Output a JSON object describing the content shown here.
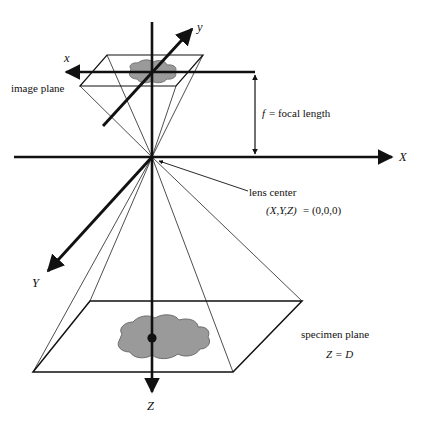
{
  "diagram": {
    "colors": {
      "stroke": "#111111",
      "thin_stroke": "#3a3a3a",
      "blob_fill": "#9a9a9a",
      "blob_stroke": "#6e6e6e",
      "background": "#ffffff"
    },
    "axes": [
      {
        "name": "x",
        "label": "x",
        "italic": true,
        "description": "image-space horizontal axis, points left"
      },
      {
        "name": "y",
        "label": "y",
        "italic": true,
        "description": "image-space axis, points upper-right"
      },
      {
        "name": "X",
        "label": "X",
        "italic": true,
        "description": "world horizontal axis, points right"
      },
      {
        "name": "Y",
        "label": "Y",
        "italic": true,
        "description": "world axis, points lower-left"
      },
      {
        "name": "Z",
        "label": "Z",
        "italic": true,
        "description": "world optical axis, points down"
      }
    ],
    "annotations": {
      "image_plane": "image plane",
      "focal_length_symbol": "f",
      "focal_length_text": "= focal length",
      "lens_center": "lens center",
      "lens_center_coords_lhs": "(X,Y,Z)",
      "lens_center_coords_rhs": "= (0,0,0)",
      "specimen_plane": "specimen plane",
      "specimen_depth_lhs": "Z",
      "specimen_depth_rhs": "= D"
    }
  }
}
